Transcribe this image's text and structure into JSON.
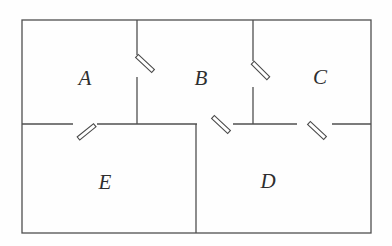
{
  "diagram": {
    "rooms": [
      {
        "label": "A"
      },
      {
        "label": "B"
      },
      {
        "label": "C"
      },
      {
        "label": "D"
      },
      {
        "label": "E"
      }
    ],
    "doors_count": "5"
  },
  "colors": {
    "wall": "#4f4f4f",
    "door": "#4a4a4a",
    "label": "#2e2e2e",
    "background": "#fefefe"
  }
}
